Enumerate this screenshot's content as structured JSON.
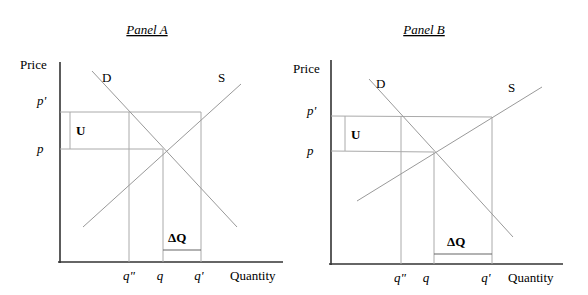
{
  "panels": [
    {
      "title": "Panel A",
      "y_axis_label": "Price",
      "x_axis_label": "Quantity",
      "price_labels": {
        "p_prime": "p'",
        "p": "p"
      },
      "quantity_labels": {
        "q_double_prime": "q\"",
        "q": "q",
        "q_prime": "q'"
      },
      "curve_labels": {
        "demand": "D",
        "supply": "S"
      },
      "region_labels": {
        "U": "U",
        "delta_q": "ΔQ"
      }
    },
    {
      "title": "Panel B",
      "y_axis_label": "Price",
      "x_axis_label": "Quantity",
      "price_labels": {
        "p_prime": "p'",
        "p": "p"
      },
      "quantity_labels": {
        "q_double_prime": "q\"",
        "q": "q",
        "q_prime": "q'"
      },
      "curve_labels": {
        "demand": "D",
        "supply": "S"
      },
      "region_labels": {
        "U": "U",
        "delta_q": "ΔQ"
      }
    }
  ],
  "colors": {
    "axis": "#333333",
    "curve": "#999999",
    "guide": "#aaaaaa"
  }
}
